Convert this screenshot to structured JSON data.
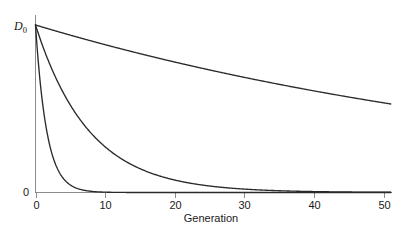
{
  "chart_data": {
    "type": "line",
    "title": "",
    "subtitle": "",
    "xlabel": "Generation",
    "ylabel": "D₀",
    "ylabel_main": "D",
    "ylabel_sub": "0",
    "xlim": [
      0,
      51
    ],
    "ylim": [
      0,
      1
    ],
    "grid": false,
    "legend": "none",
    "xticks": [
      0,
      10,
      20,
      30,
      40,
      50
    ],
    "xticklabels": [
      "0",
      "10",
      "20",
      "30",
      "40",
      "50"
    ],
    "yticks": [
      0,
      1
    ],
    "yticklabels": [
      "0",
      "D₀"
    ],
    "y_origin_label": "0",
    "x": [
      0,
      1,
      2,
      3,
      4,
      5,
      6,
      7,
      8,
      9,
      10,
      11,
      12,
      13,
      14,
      15,
      16,
      17,
      18,
      19,
      20,
      21,
      22,
      23,
      24,
      25,
      26,
      27,
      28,
      29,
      30,
      31,
      32,
      33,
      34,
      35,
      36,
      37,
      38,
      39,
      40,
      41,
      42,
      43,
      44,
      45,
      46,
      47,
      48,
      49,
      50,
      51
    ],
    "series": [
      {
        "name": "slow-decay",
        "decay_rate": 0.0125,
        "description": "shallow near-linear decline, tightly linked loci",
        "values": [
          1.0,
          0.9875,
          0.9752,
          0.963,
          0.951,
          0.9391,
          0.9274,
          0.9158,
          0.9043,
          0.893,
          0.8818,
          0.8708,
          0.8599,
          0.8492,
          0.8385,
          0.8281,
          0.8177,
          0.8075,
          0.7974,
          0.7874,
          0.7775,
          0.7678,
          0.7582,
          0.7487,
          0.7394,
          0.7301,
          0.721,
          0.712,
          0.7031,
          0.6943,
          0.6856,
          0.677,
          0.6685,
          0.6602,
          0.6519,
          0.6437,
          0.6357,
          0.6277,
          0.6199,
          0.6121,
          0.6045,
          0.5969,
          0.5894,
          0.5821,
          0.5748,
          0.5676,
          0.5605,
          0.5535,
          0.5466,
          0.5397,
          0.533,
          0.5263
        ]
      },
      {
        "name": "medium-decay",
        "decay_rate": 0.13,
        "description": "intermediate recombination rate",
        "values": [
          1.0,
          0.8781,
          0.7711,
          0.6771,
          0.5945,
          0.522,
          0.4584,
          0.4025,
          0.3535,
          0.3104,
          0.2725,
          0.2393,
          0.2101,
          0.1845,
          0.162,
          0.1423,
          0.1249,
          0.1097,
          0.0963,
          0.0846,
          0.0743,
          0.0652,
          0.0573,
          0.0503,
          0.0442,
          0.0388,
          0.0341,
          0.0299,
          0.0263,
          0.0231,
          0.0202,
          0.0178,
          0.0156,
          0.0137,
          0.012,
          0.0106,
          0.0093,
          0.0081,
          0.0071,
          0.0063,
          0.0055,
          0.0048,
          0.0042,
          0.0037,
          0.0033,
          0.0029,
          0.0025,
          0.0022,
          0.0019,
          0.0017,
          0.0015,
          0.0013
        ]
      },
      {
        "name": "fast-decay",
        "decay_rate": 0.62,
        "description": "rapid collapse, unlinked or loosely linked loci",
        "values": [
          1.0,
          0.538,
          0.2894,
          0.1557,
          0.0838,
          0.0451,
          0.0242,
          0.013,
          0.007,
          0.0038,
          0.002,
          0.0011,
          0.0006,
          0.0003,
          0.0002,
          0.0001,
          5e-05,
          3e-05,
          2e-05,
          1e-05,
          0.0,
          0.0,
          0.0,
          0.0,
          0.0,
          0.0,
          0.0,
          0.0,
          0.0,
          0.0,
          0.0,
          0.0,
          0.0,
          0.0,
          0.0,
          0.0,
          0.0,
          0.0,
          0.0,
          0.0,
          0.0,
          0.0,
          0.0,
          0.0,
          0.0,
          0.0,
          0.0,
          0.0,
          0.0,
          0.0,
          0.0,
          0.0
        ]
      }
    ],
    "colors": {
      "curve": "#2b2b2b",
      "axis": "#8c8c8c",
      "text": "#1a1a1a",
      "background": "#ffffff"
    }
  }
}
